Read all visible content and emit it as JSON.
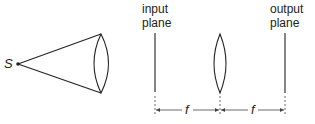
{
  "diagram": {
    "source_label": "S",
    "input_plane": {
      "line1": "input",
      "line2": "plane"
    },
    "output_plane": {
      "line1": "output",
      "line2": "plane"
    },
    "dimensions": [
      {
        "label": "f"
      },
      {
        "label": "f"
      }
    ],
    "colors": {
      "stroke": "#222222",
      "background": "#ffffff"
    }
  }
}
